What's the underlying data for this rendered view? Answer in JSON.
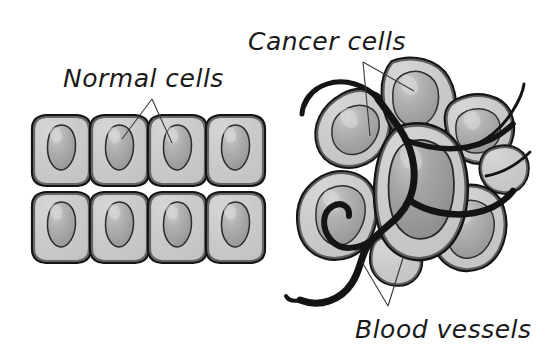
{
  "figure": {
    "background_color": "#ffffff",
    "width": 553,
    "height": 349
  },
  "labels": {
    "normal_cells": "Normal cells",
    "cancer_cells": "Cancer cells",
    "blood_vessels": "Blood vessels"
  },
  "colors": {
    "outline": "#111111",
    "cell_fill": "#c9c9c9",
    "cell_fill_light": "#d6d6d6",
    "nucleus_fill": "#a6a6a6",
    "nucleus_dark": "#949494",
    "nucleus_highlight": "#c4c4c4",
    "vessel": "#141414",
    "leader_line": "#333333",
    "text": "#1a1a1a"
  },
  "normal_cells_panel": {
    "name": "normal-cells-panel",
    "rows": 2,
    "columns": 4,
    "cell_count": 8,
    "cell_shape": "rounded-rectangle",
    "nucleus_shape": "oval",
    "description": "Regular grid of uniform, tightly packed epithelial-like cells each containing one oval nucleus"
  },
  "cancer_cells_panel": {
    "name": "cancer-cells-panel",
    "cell_count": 8,
    "cell_shape": "irregular-blob",
    "nucleus_shape": "large-irregular-oval",
    "vessel_count": 5,
    "description": "Disorganized cluster of irregular, variably sized cancer cells with enlarged nuclei, infiltrated by branching blood vessels"
  },
  "leader_lines": {
    "normal_cells": 2,
    "cancer_cells": 2,
    "blood_vessels": 2
  }
}
